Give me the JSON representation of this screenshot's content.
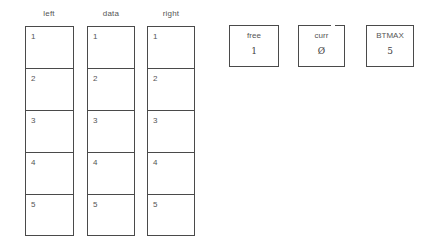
{
  "arrays": [
    {
      "name": "left",
      "cells": [
        "1",
        "2",
        "3",
        "4",
        "5"
      ]
    },
    {
      "name": "data",
      "cells": [
        "1",
        "2",
        "3",
        "4",
        "5"
      ]
    },
    {
      "name": "right",
      "cells": [
        "1",
        "2",
        "3",
        "4",
        "5"
      ]
    }
  ],
  "variables": [
    {
      "name": "free",
      "value": "1"
    },
    {
      "name": "curr",
      "value": "Ø"
    },
    {
      "name": "BTMAX",
      "value": "5"
    }
  ]
}
